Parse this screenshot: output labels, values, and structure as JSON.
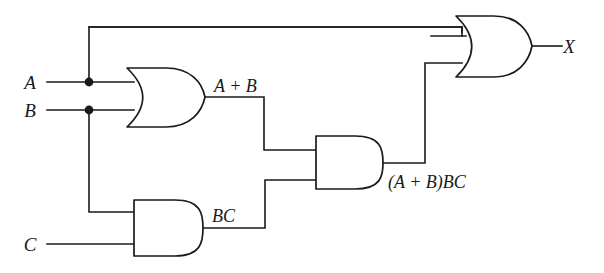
{
  "diagram": {
    "background_color": "#ffffff",
    "line_color": "#1a1a1a",
    "inputs": [
      {
        "id": "input-a",
        "label": "A",
        "x": 30,
        "y": 89
      },
      {
        "id": "input-b",
        "label": "B",
        "x": 30,
        "y": 117
      },
      {
        "id": "input-c",
        "label": "C",
        "x": 30,
        "y": 251
      }
    ],
    "outputs": [
      {
        "id": "output-x",
        "label": "X",
        "x": 569,
        "y": 53
      }
    ],
    "intermediate_labels": [
      {
        "id": "or1-output-label",
        "label": "A + B",
        "x": 214,
        "y": 92
      },
      {
        "id": "and2-output-label",
        "label": "BC",
        "x": 212,
        "y": 222
      },
      {
        "id": "and1-output-label",
        "label": "(A + B)BC",
        "x": 388,
        "y": 188
      }
    ],
    "gates": [
      {
        "id": "or-gate-ab",
        "type": "OR",
        "label": "OR",
        "inputs": [
          "A",
          "B"
        ],
        "output": "A + B"
      },
      {
        "id": "and-gate-bc",
        "type": "AND",
        "label": "AND",
        "inputs": [
          "B",
          "C"
        ],
        "output": "BC"
      },
      {
        "id": "and-gate-mid",
        "type": "AND",
        "label": "AND",
        "inputs": [
          "A + B",
          "BC"
        ],
        "output": "(A + B)BC"
      },
      {
        "id": "or-gate-out",
        "type": "OR",
        "label": "OR",
        "inputs": [
          "A",
          "(A + B)BC"
        ],
        "output": "X"
      }
    ],
    "junctions": [
      {
        "id": "junction-a",
        "signal": "A",
        "x": 89,
        "y": 82
      },
      {
        "id": "junction-b",
        "signal": "B",
        "x": 89,
        "y": 110
      }
    ]
  }
}
